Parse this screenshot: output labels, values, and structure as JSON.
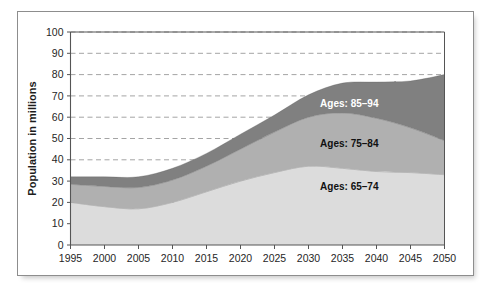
{
  "chart_data": {
    "type": "area",
    "stacked": true,
    "title": "",
    "xlabel": "",
    "ylabel": "Population in millions",
    "x": [
      1995,
      2000,
      2005,
      2010,
      2015,
      2020,
      2025,
      2030,
      2035,
      2040,
      2045,
      2050
    ],
    "categories": [
      "1995",
      "2000",
      "2005",
      "2010",
      "2015",
      "2020",
      "2025",
      "2030",
      "2035",
      "2040",
      "2045",
      "2050"
    ],
    "xlim": [
      1995,
      2050
    ],
    "ylim": [
      0,
      100
    ],
    "ytick_values": [
      0,
      10,
      20,
      30,
      40,
      50,
      60,
      70,
      80,
      90,
      100
    ],
    "ytick_labels": [
      "0",
      "10",
      "20",
      "30",
      "40",
      "50",
      "60",
      "70",
      "80",
      "90",
      "100"
    ],
    "xtick_labels": [
      "1995",
      "2000",
      "2005",
      "2010",
      "2015",
      "2020",
      "2025",
      "2030",
      "2035",
      "2040",
      "2045",
      "2050"
    ],
    "grid": true,
    "grid_style": "dashed-horizontal",
    "legend_position": "inline-on-bands",
    "series": [
      {
        "name": "Ages: 65–74",
        "label": "Ages: 65–74",
        "color": "#dcdcdc",
        "text_color": "#111111",
        "values": [
          20,
          18,
          17,
          20,
          25,
          30,
          34,
          37,
          36,
          34.5,
          34,
          33
        ]
      },
      {
        "name": "Ages: 75–84",
        "label": "Ages: 75–84",
        "color": "#b0b0b0",
        "text_color": "#111111",
        "values": [
          8.5,
          9.5,
          10,
          10.5,
          12,
          15,
          19,
          23,
          26,
          25,
          21,
          16
        ]
      },
      {
        "name": "Ages: 85–94",
        "label": "Ages: 85–94",
        "color": "#808080",
        "text_color": "#ffffff",
        "values": [
          3.5,
          4.5,
          5,
          5.5,
          6,
          7,
          8,
          10.5,
          14,
          17,
          22,
          31
        ]
      }
    ],
    "stack_tops": {
      "series_1_top": [
        20,
        18,
        17,
        20,
        25,
        30,
        34,
        37,
        36,
        34.5,
        34,
        33
      ],
      "series_2_top": [
        28.5,
        27.5,
        27,
        30.5,
        37,
        45,
        53,
        60,
        62,
        59.5,
        55,
        49
      ],
      "series_3_top": [
        32,
        32,
        32,
        36,
        43,
        52,
        61,
        70.5,
        76,
        76.5,
        77,
        80
      ]
    },
    "annotations": [
      {
        "text": "Ages: 85–94",
        "x": 2036,
        "y": 65,
        "color": "#ffffff"
      },
      {
        "text": "Ages: 75–84",
        "x": 2036,
        "y": 46,
        "color": "#111111"
      },
      {
        "text": "Ages: 65–74",
        "x": 2036,
        "y": 26,
        "color": "#111111"
      }
    ],
    "colors": {
      "band_65_74": "#dcdcdc",
      "band_75_84": "#b0b0b0",
      "band_85_94": "#808080",
      "grid": "#9a9a9a",
      "axis": "#555555",
      "frame": "#8d8d8d",
      "background": "#ffffff"
    }
  },
  "axes": {
    "y_title": "Population in millions"
  }
}
